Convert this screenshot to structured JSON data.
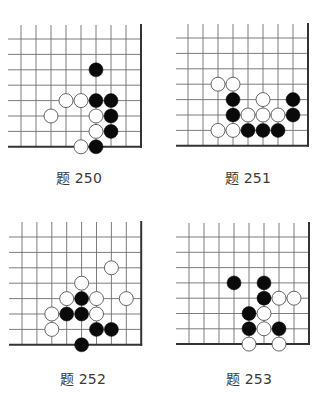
{
  "page": {
    "colors": {
      "grid_line": "#6e6e6e",
      "edge_line": "#333333",
      "black_stone": "#0a0a0a",
      "white_stone_fill": "#ffffff",
      "white_stone_stroke": "#555555",
      "caption": "#3a3a3a"
    },
    "problems": [
      {
        "label": "题 250",
        "caption_pos": [
          79,
          176
        ],
        "grid": {
          "x0": 21,
          "dx": 15,
          "cols": 9,
          "y0": 39,
          "dy": 15.4,
          "rows": 8,
          "top": 25,
          "left": 8,
          "edges": [
            "right",
            "bottom"
          ]
        },
        "stones": [
          {
            "c": 5,
            "r": 2,
            "color": "black"
          },
          {
            "c": 3,
            "r": 4,
            "color": "white"
          },
          {
            "c": 4,
            "r": 4,
            "color": "white"
          },
          {
            "c": 5,
            "r": 4,
            "color": "black"
          },
          {
            "c": 6,
            "r": 4,
            "color": "black"
          },
          {
            "c": 2,
            "r": 5,
            "color": "white"
          },
          {
            "c": 5,
            "r": 5,
            "color": "white"
          },
          {
            "c": 6,
            "r": 5,
            "color": "black"
          },
          {
            "c": 5,
            "r": 6,
            "color": "white"
          },
          {
            "c": 6,
            "r": 6,
            "color": "black"
          },
          {
            "c": 4,
            "r": 7,
            "color": "white"
          },
          {
            "c": 5,
            "r": 7,
            "color": "black"
          }
        ]
      },
      {
        "label": "题 251",
        "caption_pos": [
          248,
          176
        ],
        "grid": {
          "x0": 188,
          "dx": 15,
          "cols": 9,
          "y0": 38,
          "dy": 15.4,
          "rows": 8,
          "top": 24,
          "left": 176,
          "edges": [
            "right",
            "bottom"
          ]
        },
        "stones": [
          {
            "c": 2,
            "r": 3,
            "color": "white"
          },
          {
            "c": 3,
            "r": 3,
            "color": "white"
          },
          {
            "c": 3,
            "r": 4,
            "color": "black"
          },
          {
            "c": 5,
            "r": 4,
            "color": "white"
          },
          {
            "c": 7,
            "r": 4,
            "color": "black"
          },
          {
            "c": 3,
            "r": 5,
            "color": "black"
          },
          {
            "c": 4,
            "r": 5,
            "color": "white"
          },
          {
            "c": 5,
            "r": 5,
            "color": "white"
          },
          {
            "c": 6,
            "r": 5,
            "color": "white"
          },
          {
            "c": 7,
            "r": 5,
            "color": "black"
          },
          {
            "c": 2,
            "r": 6,
            "color": "white"
          },
          {
            "c": 3,
            "r": 6,
            "color": "white"
          },
          {
            "c": 4,
            "r": 6,
            "color": "black"
          },
          {
            "c": 5,
            "r": 6,
            "color": "black"
          },
          {
            "c": 6,
            "r": 6,
            "color": "black"
          }
        ]
      },
      {
        "label": "题 252",
        "caption_pos": [
          83,
          377
        ],
        "grid": {
          "x0": 22,
          "dx": 14.9,
          "cols": 9,
          "y0": 237,
          "dy": 15.4,
          "rows": 8,
          "top": 222,
          "left": 9,
          "edges": [
            "right",
            "bottom"
          ]
        },
        "stones": [
          {
            "c": 6,
            "r": 2,
            "color": "white"
          },
          {
            "c": 4,
            "r": 3,
            "color": "white"
          },
          {
            "c": 3,
            "r": 4,
            "color": "white"
          },
          {
            "c": 4,
            "r": 4,
            "color": "black"
          },
          {
            "c": 5,
            "r": 4,
            "color": "white"
          },
          {
            "c": 7,
            "r": 4,
            "color": "white"
          },
          {
            "c": 2,
            "r": 5,
            "color": "white"
          },
          {
            "c": 3,
            "r": 5,
            "color": "black"
          },
          {
            "c": 4,
            "r": 5,
            "color": "black"
          },
          {
            "c": 5,
            "r": 5,
            "color": "white"
          },
          {
            "c": 2,
            "r": 6,
            "color": "white"
          },
          {
            "c": 5,
            "r": 6,
            "color": "black"
          },
          {
            "c": 6,
            "r": 6,
            "color": "black"
          },
          {
            "c": 4,
            "r": 7,
            "color": "black"
          }
        ]
      },
      {
        "label": "题 253",
        "caption_pos": [
          249,
          377
        ],
        "grid": {
          "x0": 189,
          "dx": 15,
          "cols": 9,
          "y0": 237,
          "dy": 15.3,
          "rows": 8,
          "top": 223,
          "left": 176,
          "edges": [
            "right",
            "bottom"
          ]
        },
        "stones": [
          {
            "c": 3,
            "r": 3,
            "color": "black"
          },
          {
            "c": 5,
            "r": 3,
            "color": "black"
          },
          {
            "c": 5,
            "r": 4,
            "color": "black"
          },
          {
            "c": 6,
            "r": 4,
            "color": "white"
          },
          {
            "c": 7,
            "r": 4,
            "color": "white"
          },
          {
            "c": 4,
            "r": 5,
            "color": "black"
          },
          {
            "c": 5,
            "r": 5,
            "color": "white"
          },
          {
            "c": 4,
            "r": 6,
            "color": "black"
          },
          {
            "c": 5,
            "r": 6,
            "color": "white"
          },
          {
            "c": 6,
            "r": 6,
            "color": "black"
          },
          {
            "c": 4,
            "r": 7,
            "color": "white"
          },
          {
            "c": 6,
            "r": 7,
            "color": "white"
          }
        ]
      }
    ]
  }
}
